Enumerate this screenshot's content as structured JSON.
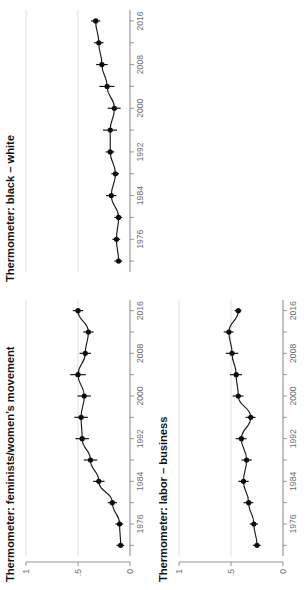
{
  "figure": {
    "orientation": "rotated-90",
    "background": "#ffffff",
    "ink_color": "#111111",
    "grid_color": "#ececec",
    "axis_color": "#8a8a8a"
  },
  "panels": [
    {
      "id": "feminists",
      "title": "Thermometer: feminists/women’s movement",
      "show_y_axis": true
    },
    {
      "id": "black_white",
      "title": "Thermometer: black – white",
      "show_y_axis": false
    },
    {
      "id": "labor_business",
      "title": "Thermometer: labor – business",
      "show_y_axis": true
    }
  ],
  "axes": {
    "x_tick_labels": [
      "1976",
      "1984",
      "1992",
      "2000",
      "2008",
      "2016"
    ],
    "x_minor_ticks": [
      1972,
      1980,
      1988,
      1996,
      2004,
      2012
    ],
    "x_all_ticks": [
      1972,
      1976,
      1980,
      1984,
      1988,
      1992,
      1996,
      2000,
      2004,
      2008,
      2012,
      2016
    ],
    "x_limits": [
      1970,
      2018
    ],
    "y_tick_labels": [
      "0",
      ".5",
      "1"
    ],
    "y_tick_values": [
      0,
      0.5,
      1
    ],
    "y_limits": [
      0,
      1
    ]
  },
  "chart_data": {
    "type": "scatter",
    "xlabel": "",
    "ylabel": "",
    "xlim": [
      1970,
      2018
    ],
    "ylim": [
      0,
      1
    ],
    "grid": true,
    "legend": "none",
    "marker": "filled-circle",
    "error_bars": "horizontal (95% CI on estimate axis)",
    "series": [
      {
        "name": "Thermometer: feminists/women’s movement",
        "panel": "feminists",
        "x": [
          1972,
          1976,
          1980,
          1984,
          1988,
          1992,
          1996,
          2000,
          2004,
          2008,
          2012,
          2016
        ],
        "values": [
          0.09,
          0.1,
          0.17,
          0.3,
          0.38,
          0.46,
          0.47,
          0.44,
          0.5,
          0.43,
          0.4,
          0.5
        ],
        "err_low": [
          0.055,
          0.065,
          0.125,
          0.245,
          0.315,
          0.395,
          0.405,
          0.375,
          0.425,
          0.375,
          0.35,
          0.45
        ],
        "err_high": [
          0.13,
          0.14,
          0.215,
          0.355,
          0.445,
          0.525,
          0.535,
          0.505,
          0.575,
          0.485,
          0.45,
          0.55
        ]
      },
      {
        "name": "Thermometer: black – white",
        "panel": "black_white",
        "x": [
          1972,
          1976,
          1980,
          1984,
          1988,
          1992,
          1996,
          2000,
          2004,
          2008,
          2012,
          2016
        ],
        "values": [
          0.11,
          0.13,
          0.11,
          0.18,
          0.14,
          0.19,
          0.19,
          0.15,
          0.22,
          0.27,
          0.3,
          0.33
        ],
        "err_low": [
          0.075,
          0.095,
          0.075,
          0.13,
          0.105,
          0.15,
          0.125,
          0.09,
          0.15,
          0.215,
          0.255,
          0.285
        ],
        "err_high": [
          0.15,
          0.17,
          0.15,
          0.23,
          0.18,
          0.235,
          0.26,
          0.215,
          0.295,
          0.325,
          0.345,
          0.375
        ]
      },
      {
        "name": "Thermometer: labor – business",
        "panel": "labor_business",
        "x": [
          1972,
          1976,
          1980,
          1984,
          1988,
          1992,
          1996,
          2000,
          2004,
          2008,
          2012,
          2016
        ],
        "values": [
          0.25,
          0.28,
          0.33,
          0.38,
          0.35,
          0.4,
          0.31,
          0.43,
          0.45,
          0.49,
          0.52,
          0.43
        ],
        "err_low": [
          0.215,
          0.24,
          0.285,
          0.33,
          0.3,
          0.35,
          0.265,
          0.38,
          0.395,
          0.43,
          0.475,
          0.4
        ],
        "err_high": [
          0.29,
          0.32,
          0.38,
          0.43,
          0.4,
          0.455,
          0.36,
          0.485,
          0.51,
          0.55,
          0.57,
          0.465
        ]
      }
    ]
  }
}
